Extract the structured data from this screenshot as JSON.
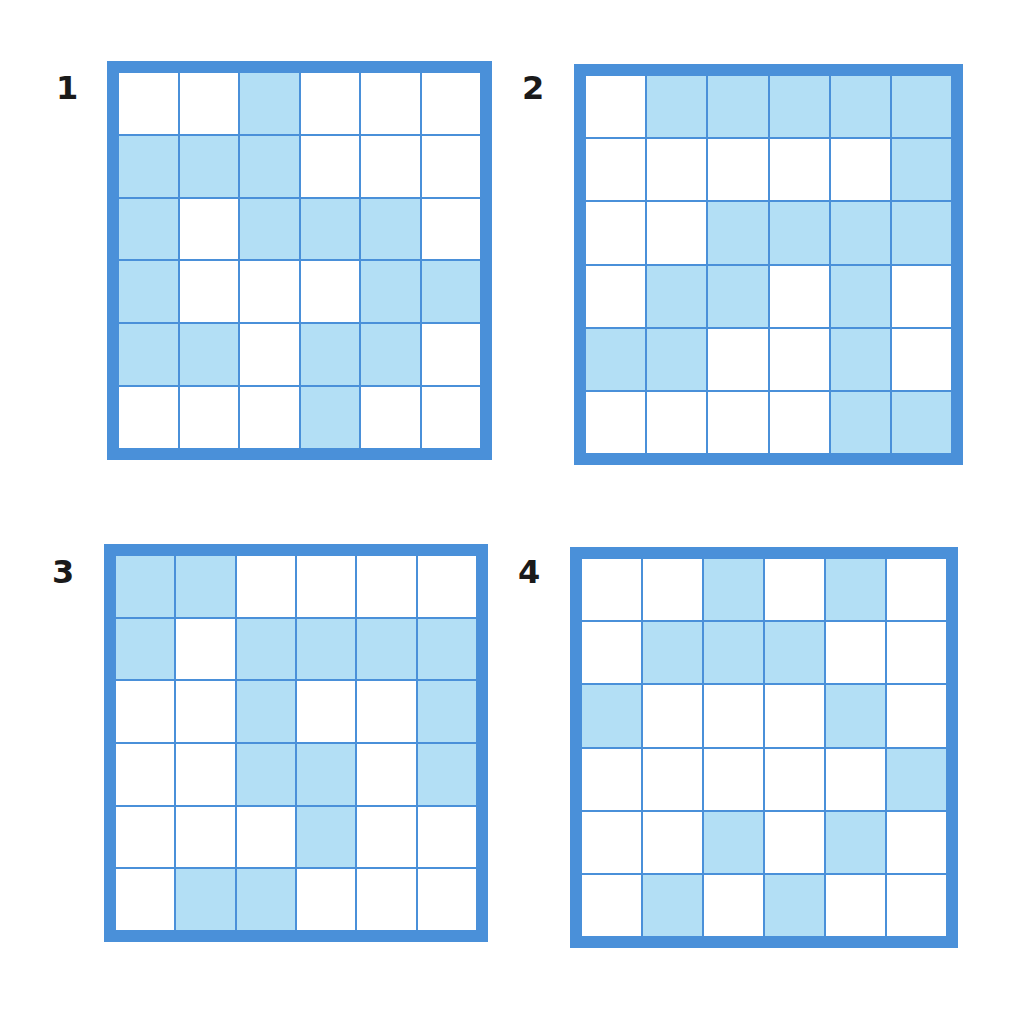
{
  "colors": {
    "border": "#4a90d9",
    "shaded": "#b3dff5",
    "empty": "#ffffff",
    "label": "#1a1a1a"
  },
  "panels": [
    {
      "label": "1",
      "rows": 6,
      "cols": 6,
      "cells": [
        [
          0,
          0,
          1,
          0,
          0,
          0
        ],
        [
          1,
          1,
          1,
          0,
          0,
          0
        ],
        [
          1,
          0,
          1,
          1,
          1,
          0
        ],
        [
          1,
          0,
          0,
          0,
          1,
          1
        ],
        [
          1,
          1,
          0,
          1,
          1,
          0
        ],
        [
          0,
          0,
          0,
          1,
          0,
          0
        ]
      ]
    },
    {
      "label": "2",
      "rows": 6,
      "cols": 6,
      "cells": [
        [
          0,
          1,
          1,
          1,
          1,
          1
        ],
        [
          0,
          0,
          0,
          0,
          0,
          1
        ],
        [
          0,
          0,
          1,
          1,
          1,
          1
        ],
        [
          0,
          1,
          1,
          0,
          1,
          0
        ],
        [
          1,
          1,
          0,
          0,
          1,
          0
        ],
        [
          0,
          0,
          0,
          0,
          1,
          1
        ]
      ]
    },
    {
      "label": "3",
      "rows": 6,
      "cols": 6,
      "cells": [
        [
          1,
          1,
          0,
          0,
          0,
          0
        ],
        [
          1,
          0,
          1,
          1,
          1,
          1
        ],
        [
          0,
          0,
          1,
          0,
          0,
          1
        ],
        [
          0,
          0,
          1,
          1,
          0,
          1
        ],
        [
          0,
          0,
          0,
          1,
          0,
          0
        ],
        [
          0,
          1,
          1,
          0,
          0,
          0
        ]
      ]
    },
    {
      "label": "4",
      "rows": 6,
      "cols": 6,
      "cells": [
        [
          0,
          0,
          1,
          0,
          1,
          0
        ],
        [
          0,
          1,
          1,
          1,
          0,
          0
        ],
        [
          1,
          0,
          0,
          0,
          1,
          0
        ],
        [
          0,
          0,
          0,
          0,
          0,
          1
        ],
        [
          0,
          0,
          1,
          0,
          1,
          0
        ],
        [
          0,
          1,
          0,
          1,
          0,
          0
        ]
      ]
    }
  ]
}
